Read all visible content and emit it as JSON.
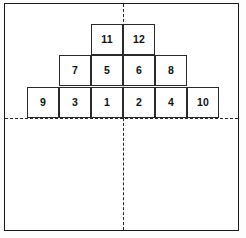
{
  "figure": {
    "frame": {
      "border_color": "#1a1a1a",
      "background": "#ffffff"
    },
    "axes": {
      "horizontal": {
        "name": "horizontal-dashed-axis",
        "style": "dashed",
        "color": "#242424"
      },
      "vertical": {
        "name": "vertical-dashed-axis",
        "style": "dashed",
        "color": "#242424"
      }
    },
    "block_style": {
      "border_color": "#2a2a2a",
      "fill_color": "#ffffff",
      "label_color": "#111111"
    },
    "rows": [
      {
        "name": "top-row",
        "blocks": [
          {
            "label": "11",
            "column": "col-n1"
          },
          {
            "label": "12",
            "column": "col-p1"
          }
        ]
      },
      {
        "name": "middle-row",
        "blocks": [
          {
            "label": "7",
            "column": "col-n2"
          },
          {
            "label": "5",
            "column": "col-n1"
          },
          {
            "label": "6",
            "column": "col-p1"
          },
          {
            "label": "8",
            "column": "col-p2"
          }
        ]
      },
      {
        "name": "bottom-row",
        "blocks": [
          {
            "label": "9",
            "column": "col-n3"
          },
          {
            "label": "3",
            "column": "col-n2"
          },
          {
            "label": "1",
            "column": "col-n1"
          },
          {
            "label": "2",
            "column": "col-p1"
          },
          {
            "label": "4",
            "column": "col-p2"
          },
          {
            "label": "10",
            "column": "col-p3"
          }
        ]
      }
    ]
  }
}
